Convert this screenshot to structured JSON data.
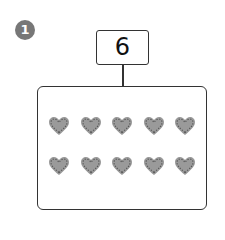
{
  "problem": {
    "number_label": "1",
    "total_value": "6",
    "items": {
      "shape": "heart",
      "color": "#9a9a9a",
      "rows": 2,
      "per_row": 5,
      "count": 10
    }
  }
}
